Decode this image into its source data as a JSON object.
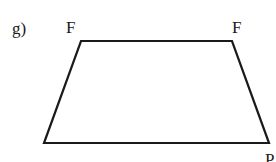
{
  "figure": {
    "label": "g)",
    "shape": "trapezoid",
    "stroke_color": "#1a1a1a",
    "vertices": {
      "top_left": {
        "x": 81,
        "y": 41,
        "label": "F"
      },
      "top_right": {
        "x": 232,
        "y": 41,
        "label": "F"
      },
      "bottom_right": {
        "x": 269,
        "y": 143,
        "label": "P"
      },
      "bottom_left": {
        "x": 44,
        "y": 143,
        "label": ""
      }
    }
  }
}
